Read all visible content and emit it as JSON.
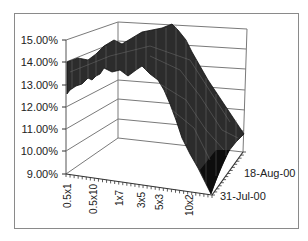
{
  "chart_data": {
    "type": "surface",
    "title": "",
    "xlabel": "",
    "ylabel": "",
    "zlabel": "",
    "y_ticks": [
      "15.00%",
      "14.00%",
      "13.00%",
      "12.00%",
      "11.00%",
      "10.00%",
      "9.00%"
    ],
    "ylim": [
      0.09,
      0.15
    ],
    "categories": [
      "0.5x1",
      "0.5x10",
      "1x7",
      "3x5",
      "5x3",
      "10x2"
    ],
    "depth_ticks": [
      "18-Aug-00",
      "31-Jul-00"
    ],
    "grid": true,
    "legend": "none",
    "series_profile": {
      "x": [
        "0.5x1",
        "0.5x10",
        "1x7",
        "3x5",
        "5x3",
        "10x2"
      ],
      "approx_values": [
        0.135,
        0.132,
        0.142,
        0.146,
        0.14,
        0.112
      ],
      "note": "surface rises from ~13.5% at short maturities to peak ~14.6% mid-range, then falls steeply toward ~9% at 10x2 front edge"
    },
    "surface_color": "#2a2a2a"
  }
}
